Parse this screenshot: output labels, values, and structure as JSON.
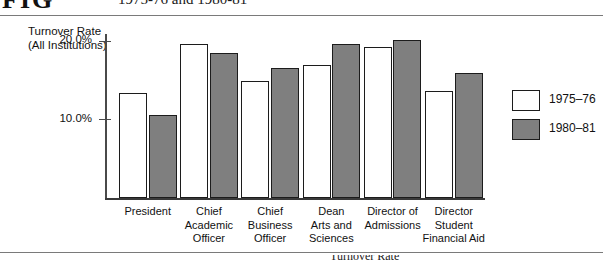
{
  "figure": {
    "number_fragment": "FIG",
    "caption_fragment": "1975-76 and 1980-81",
    "bottom_caption_fragment": "Turnover Rate"
  },
  "chart_data": {
    "type": "bar",
    "title": "",
    "ylabel_line1": "Turnover Rate",
    "ylabel_line2": "(All Institutions)",
    "xlabel": "",
    "ylim": [
      0,
      23.5
    ],
    "yticks": [
      10,
      20
    ],
    "ytick_labels": [
      "10.0%",
      "20.0%"
    ],
    "grid": false,
    "legend_position": "right",
    "categories": [
      "President",
      "Chief Academic Officer",
      "Chief Business Officer",
      "Dean Arts and Sciences",
      "Director of Admissions",
      "Director Student Financial Aid"
    ],
    "category_label_lines": [
      [
        "President"
      ],
      [
        "Chief",
        "Academic",
        "Officer"
      ],
      [
        "Chief",
        "Business",
        "Officer"
      ],
      [
        "Dean",
        "Arts and",
        "Sciences"
      ],
      [
        "Director of",
        "Admissions"
      ],
      [
        "Director",
        "Student",
        "Financial Aid"
      ]
    ],
    "series": [
      {
        "name": "1975-76",
        "color": "#ffffff",
        "values": [
          13.4,
          19.6,
          14.9,
          17.0,
          19.3,
          13.7
        ]
      },
      {
        "name": "1980-81",
        "color": "#7f7f7f",
        "values": [
          10.6,
          18.5,
          16.6,
          19.7,
          20.2,
          16.0
        ]
      }
    ]
  },
  "legend": {
    "items": [
      {
        "label": "1975–76",
        "swatch": "white"
      },
      {
        "label": "1980–81",
        "swatch": "gray"
      }
    ]
  },
  "colors": {
    "series_1975": "#ffffff",
    "series_1980": "#7f7f7f",
    "outline": "#1c1c1c",
    "axis": "#4a4a4a",
    "rule": "#7a7a7a",
    "background": "#ffffff"
  }
}
